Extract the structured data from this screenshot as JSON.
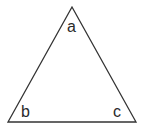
{
  "diagram": {
    "type": "triangle",
    "stroke_color": "#333333",
    "vertices": {
      "a": {
        "x": 72,
        "y": 7
      },
      "b": {
        "x": 8,
        "y": 122
      },
      "c": {
        "x": 136,
        "y": 122
      }
    },
    "labels": {
      "a": "a",
      "b": "b",
      "c": "c"
    }
  }
}
